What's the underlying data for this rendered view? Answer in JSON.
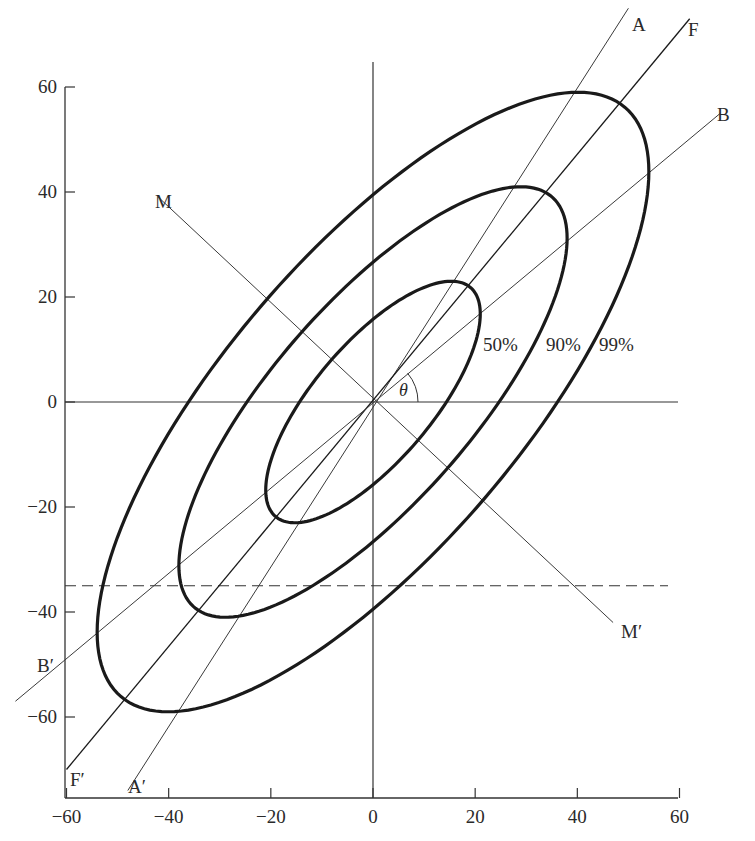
{
  "chart_data": {
    "type": "scatter",
    "title": "",
    "xlabel": "",
    "ylabel": "",
    "xlim": [
      -60,
      60
    ],
    "ylim": [
      -75,
      65
    ],
    "grid": false,
    "x_ticks": [
      -60,
      -40,
      -20,
      0,
      20,
      40,
      60
    ],
    "y_ticks": [
      60,
      40,
      20,
      0,
      -20,
      -40,
      -60
    ],
    "x_tick_labels": [
      "−60",
      "−40",
      "−20",
      "0",
      "20",
      "40",
      "60"
    ],
    "y_tick_labels": [
      "60",
      "40",
      "20",
      "0",
      "−20",
      "−40",
      "−60"
    ],
    "ellipses": [
      {
        "label": "50%",
        "center": [
          0,
          0
        ],
        "ymax_point": [
          16,
          23
        ],
        "xmax_point": [
          21,
          16
        ]
      },
      {
        "label": "90%",
        "center": [
          0,
          0
        ],
        "ymax_point": [
          30,
          41
        ],
        "xmax_point": [
          38,
          30
        ]
      },
      {
        "label": "99%",
        "center": [
          0,
          0
        ],
        "ymax_point": [
          40,
          59
        ],
        "xmax_point": [
          54,
          44
        ]
      }
    ],
    "lines": [
      {
        "name": "A",
        "start_label": "A′",
        "start": [
          -48,
          -74
        ],
        "end": [
          50,
          75
        ]
      },
      {
        "name": "F",
        "start_label": "F′",
        "start": [
          -60,
          -70
        ],
        "end": [
          62,
          73
        ]
      },
      {
        "name": "B",
        "start_label": "B′",
        "start": [
          -70,
          -57
        ],
        "end": [
          68,
          55
        ]
      },
      {
        "name": "M",
        "start_label": "M",
        "end_label": "M′",
        "start": [
          -42,
          39
        ],
        "end": [
          47,
          -42
        ]
      }
    ],
    "dashed_line": {
      "y": -35,
      "x_range": [
        -60,
        60
      ]
    },
    "angle_annotation": {
      "symbol": "θ",
      "from_axis": "x",
      "to_line": "B"
    },
    "annotations": [
      "50%",
      "90%",
      "99%",
      "A",
      "A′",
      "F",
      "F′",
      "B",
      "B′",
      "M",
      "M′",
      "θ"
    ]
  },
  "labels": {
    "A": "A",
    "A_prime": "A′",
    "F": "F",
    "F_prime": "F′",
    "B": "B",
    "B_prime": "B′",
    "M": "M",
    "M_prime": "M′",
    "theta": "θ",
    "p50": "50%",
    "p90": "90%",
    "p99": "99%"
  },
  "style": {
    "ink": "#1a1a1a",
    "thin_ink": "#3a3a3a",
    "background": "#ffffff"
  }
}
